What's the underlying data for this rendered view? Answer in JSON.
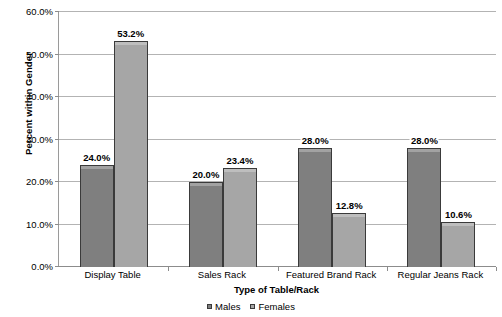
{
  "chart_data": {
    "type": "bar",
    "title": "",
    "xlabel": "Type of Table/Rack",
    "ylabel": "Percent within Gender",
    "categories": [
      "Display Table",
      "Sales Rack",
      "Featured Brand Rack",
      "Regular Jeans Rack"
    ],
    "series": [
      {
        "name": "Males",
        "color": "#7f7f7f",
        "values": [
          24.0,
          20.0,
          28.0,
          28.0
        ],
        "labels": [
          "24.0%",
          "20.0%",
          "28.0%",
          "28.0%"
        ]
      },
      {
        "name": "Females",
        "color": "#a6a6a6",
        "values": [
          53.2,
          23.4,
          12.8,
          10.6
        ],
        "labels": [
          "53.2%",
          "23.4%",
          "12.8%",
          "10.6%"
        ]
      }
    ],
    "ylim": [
      0,
      60
    ],
    "yticks": [
      0,
      10,
      20,
      30,
      40,
      50,
      60
    ],
    "ytick_labels": [
      "0.0%",
      "10.0%",
      "20.0%",
      "30.0%",
      "40.0%",
      "50.0%",
      "60.0%"
    ],
    "grid": true,
    "legend_position": "bottom"
  },
  "axes": {
    "y_title": "Percent within Gender",
    "x_title": "Type of Table/Rack"
  },
  "legend": {
    "items": [
      {
        "label": "Males",
        "color": "#7f7f7f"
      },
      {
        "label": "Females",
        "color": "#a6a6a6"
      }
    ]
  },
  "colors": {
    "males": "#7f7f7f",
    "females": "#a6a6a6",
    "gridline": "#b3b3b3",
    "axis": "#8c8c8c",
    "bar_border": "#3a3a3a"
  }
}
